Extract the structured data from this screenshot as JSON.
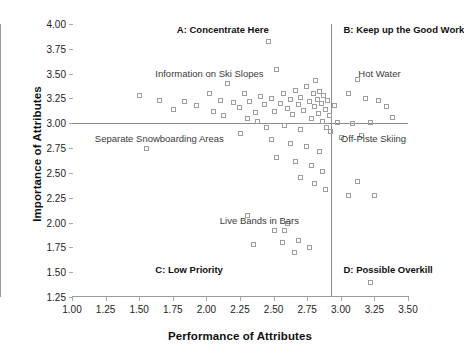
{
  "chart_data": {
    "type": "scatter",
    "title": "",
    "xlabel": "Performance of Attributes",
    "ylabel": "Importance of Attributes",
    "xlim": [
      1.0,
      3.5
    ],
    "ylim": [
      1.25,
      4.0
    ],
    "xticks": [
      "1.00",
      "1.25",
      "1.50",
      "1.75",
      "2.00",
      "2.25",
      "2.50",
      "2.75",
      "3.00",
      "3.25",
      "3.50"
    ],
    "xtick_values": [
      1.0,
      1.25,
      1.5,
      1.75,
      2.0,
      2.25,
      2.5,
      2.75,
      3.0,
      3.25,
      3.5
    ],
    "yticks": [
      "1.25",
      "1.50",
      "1.75",
      "2.00",
      "2.25",
      "2.50",
      "2.75",
      "3.00",
      "3.25",
      "3.50",
      "3.75",
      "4.00"
    ],
    "ytick_values": [
      1.25,
      1.5,
      1.75,
      2.0,
      2.25,
      2.5,
      2.75,
      3.0,
      3.25,
      3.5,
      3.75,
      4.0
    ],
    "grid": false,
    "legend": "none",
    "marker": "open-square",
    "marker_color": "#9d9d9d",
    "crosshair": {
      "x": 2.93,
      "y": 3.0,
      "color": "#8c8c8c"
    },
    "quadrant_labels": [
      {
        "key": "A",
        "text": "A: Concentrate Here",
        "x": 1.78,
        "y": 3.94
      },
      {
        "key": "B",
        "text": "B: Keep up the Good Work",
        "x": 3.02,
        "y": 3.94
      },
      {
        "key": "C",
        "text": "C: Low Priority",
        "x": 1.62,
        "y": 1.52
      },
      {
        "key": "D",
        "text": "D: Possible Overkill",
        "x": 3.02,
        "y": 1.52
      }
    ],
    "annotations": [
      {
        "text": "Information on Ski Slopes",
        "x": 1.62,
        "y": 3.5
      },
      {
        "text": "Hot Water",
        "x": 3.13,
        "y": 3.5
      },
      {
        "text": "Separate Snowboarding Areas",
        "x": 1.17,
        "y": 2.84
      },
      {
        "text": "Off-Piste Skiing",
        "x": 3.0,
        "y": 2.84
      },
      {
        "text": "Live Bands in Bars",
        "x": 2.1,
        "y": 2.02
      }
    ],
    "points": [
      {
        "x": 1.5,
        "y": 3.28
      },
      {
        "x": 1.65,
        "y": 3.23
      },
      {
        "x": 1.83,
        "y": 3.22
      },
      {
        "x": 1.92,
        "y": 3.18
      },
      {
        "x": 2.02,
        "y": 3.3
      },
      {
        "x": 2.1,
        "y": 3.23
      },
      {
        "x": 2.15,
        "y": 3.41
      },
      {
        "x": 2.2,
        "y": 3.21
      },
      {
        "x": 2.24,
        "y": 3.16
      },
      {
        "x": 2.28,
        "y": 3.3
      },
      {
        "x": 2.32,
        "y": 3.22
      },
      {
        "x": 2.36,
        "y": 3.11
      },
      {
        "x": 2.4,
        "y": 3.27
      },
      {
        "x": 2.43,
        "y": 3.19
      },
      {
        "x": 2.46,
        "y": 3.83
      },
      {
        "x": 2.48,
        "y": 3.25
      },
      {
        "x": 2.5,
        "y": 3.12
      },
      {
        "x": 2.52,
        "y": 3.55
      },
      {
        "x": 2.55,
        "y": 3.2
      },
      {
        "x": 2.57,
        "y": 3.3
      },
      {
        "x": 2.6,
        "y": 3.15
      },
      {
        "x": 2.62,
        "y": 3.24
      },
      {
        "x": 2.64,
        "y": 3.09
      },
      {
        "x": 2.66,
        "y": 3.34
      },
      {
        "x": 2.68,
        "y": 3.19
      },
      {
        "x": 2.7,
        "y": 3.26
      },
      {
        "x": 2.72,
        "y": 3.13
      },
      {
        "x": 2.74,
        "y": 3.38
      },
      {
        "x": 2.76,
        "y": 3.22
      },
      {
        "x": 2.78,
        "y": 3.05
      },
      {
        "x": 2.79,
        "y": 3.3
      },
      {
        "x": 2.8,
        "y": 3.17
      },
      {
        "x": 2.81,
        "y": 3.44
      },
      {
        "x": 2.82,
        "y": 3.24
      },
      {
        "x": 2.83,
        "y": 3.1
      },
      {
        "x": 2.84,
        "y": 3.33
      },
      {
        "x": 2.85,
        "y": 3.2
      },
      {
        "x": 2.86,
        "y": 3.02
      },
      {
        "x": 2.87,
        "y": 3.28
      },
      {
        "x": 2.88,
        "y": 3.14
      },
      {
        "x": 2.89,
        "y": 2.96
      },
      {
        "x": 2.9,
        "y": 3.23
      },
      {
        "x": 2.91,
        "y": 3.08
      },
      {
        "x": 2.92,
        "y": 2.92
      },
      {
        "x": 2.95,
        "y": 3.18
      },
      {
        "x": 2.97,
        "y": 3.01
      },
      {
        "x": 3.0,
        "y": 2.86
      },
      {
        "x": 3.05,
        "y": 3.3
      },
      {
        "x": 3.08,
        "y": 3.0
      },
      {
        "x": 3.12,
        "y": 3.45
      },
      {
        "x": 3.15,
        "y": 2.88
      },
      {
        "x": 3.18,
        "y": 3.25
      },
      {
        "x": 3.22,
        "y": 3.01
      },
      {
        "x": 3.28,
        "y": 3.23
      },
      {
        "x": 3.34,
        "y": 3.17
      },
      {
        "x": 3.38,
        "y": 3.06
      },
      {
        "x": 1.55,
        "y": 2.75
      },
      {
        "x": 2.3,
        "y": 3.05
      },
      {
        "x": 2.05,
        "y": 3.12
      },
      {
        "x": 1.75,
        "y": 3.14
      },
      {
        "x": 2.12,
        "y": 3.08
      },
      {
        "x": 2.38,
        "y": 3.02
      },
      {
        "x": 2.44,
        "y": 2.96
      },
      {
        "x": 2.58,
        "y": 2.98
      },
      {
        "x": 2.7,
        "y": 2.94
      },
      {
        "x": 2.25,
        "y": 2.9
      },
      {
        "x": 2.48,
        "y": 2.84
      },
      {
        "x": 2.62,
        "y": 2.8
      },
      {
        "x": 2.74,
        "y": 2.77
      },
      {
        "x": 2.84,
        "y": 2.72
      },
      {
        "x": 2.52,
        "y": 2.66
      },
      {
        "x": 2.66,
        "y": 2.62
      },
      {
        "x": 2.78,
        "y": 2.58
      },
      {
        "x": 2.86,
        "y": 2.52
      },
      {
        "x": 2.7,
        "y": 2.46
      },
      {
        "x": 2.8,
        "y": 2.4
      },
      {
        "x": 2.88,
        "y": 2.34
      },
      {
        "x": 3.12,
        "y": 2.42
      },
      {
        "x": 3.05,
        "y": 2.28
      },
      {
        "x": 3.25,
        "y": 2.28
      },
      {
        "x": 2.3,
        "y": 2.08
      },
      {
        "x": 2.6,
        "y": 2.0
      },
      {
        "x": 2.5,
        "y": 1.92
      },
      {
        "x": 2.58,
        "y": 1.92
      },
      {
        "x": 2.56,
        "y": 1.8
      },
      {
        "x": 2.68,
        "y": 1.82
      },
      {
        "x": 2.65,
        "y": 1.7
      },
      {
        "x": 2.76,
        "y": 1.75
      },
      {
        "x": 2.35,
        "y": 1.78
      },
      {
        "x": 3.22,
        "y": 1.4
      }
    ]
  }
}
